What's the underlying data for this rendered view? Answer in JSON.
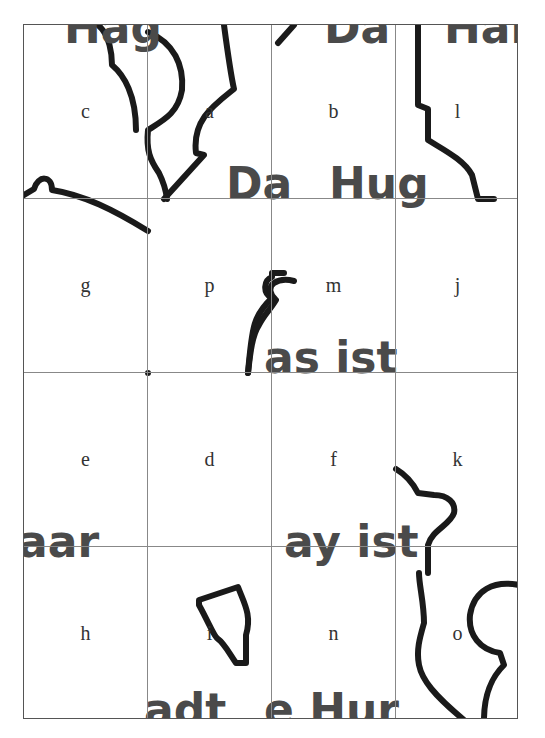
{
  "puzzle": {
    "rows": 4,
    "cols": 4,
    "pieces": [
      {
        "label": "c"
      },
      {
        "label": "a"
      },
      {
        "label": "b"
      },
      {
        "label": "l"
      },
      {
        "label": "g"
      },
      {
        "label": "p"
      },
      {
        "label": "m"
      },
      {
        "label": "j"
      },
      {
        "label": "e"
      },
      {
        "label": "d"
      },
      {
        "label": "f"
      },
      {
        "label": "k"
      },
      {
        "label": "h"
      },
      {
        "label": "i"
      },
      {
        "label": "n"
      },
      {
        "label": "o"
      }
    ],
    "fragments": {
      "c": "Hag",
      "b": "Da",
      "l": "Hai",
      "a_bottom": "Da",
      "b_bottom": "Hug",
      "m_bottom": "as ist",
      "h_top": "aar",
      "n_top": "ay ist",
      "i_bottom": "adt",
      "n_bottom": "e Hur"
    },
    "colors": {
      "stroke": "#1a1a1a",
      "text": "#4a4a4a",
      "grid": "#888888"
    }
  }
}
